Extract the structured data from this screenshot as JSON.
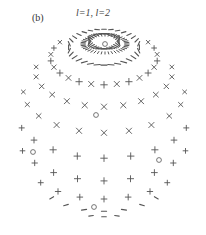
{
  "figure": {
    "panel_label": "(b)",
    "title": "l=1, l=2",
    "title_parts": {
      "first": "l=1",
      "separator": ", ",
      "second": "l=2"
    }
  },
  "sphere": {
    "center": [
      104,
      123
    ],
    "radius_x": 87,
    "radius_y": 94,
    "tilt_deg": 28,
    "marker_color": "#555555",
    "rings": [
      {
        "lat": 80,
        "count": 34,
        "marker": "dash"
      },
      {
        "lat": 66,
        "count": 32,
        "marker": "dash"
      },
      {
        "lat": 52,
        "count": 26,
        "marker": "cross"
      },
      {
        "lat": 38,
        "count": 22,
        "marker": "x"
      },
      {
        "lat": 22,
        "count": 20,
        "marker": "x"
      },
      {
        "lat": 6,
        "count": 20,
        "marker": "plus"
      },
      {
        "lat": -10,
        "count": 20,
        "marker": "plus"
      },
      {
        "lat": -26,
        "count": 20,
        "marker": "plus"
      },
      {
        "lat": -42,
        "count": 20,
        "marker": "dash"
      },
      {
        "lat": -58,
        "count": 22,
        "marker": "dash"
      }
    ],
    "poles": [
      {
        "x": 105,
        "y": 44,
        "marker": "circle"
      },
      {
        "x": 96,
        "y": 115,
        "marker": "circle"
      },
      {
        "x": 33,
        "y": 152,
        "marker": "circle"
      },
      {
        "x": 159,
        "y": 160,
        "marker": "circle"
      },
      {
        "x": 94,
        "y": 207,
        "marker": "circle"
      }
    ],
    "top_ring": {
      "cx": 105,
      "cy": 44,
      "rx": 22,
      "ry": 9,
      "count": 40
    }
  }
}
